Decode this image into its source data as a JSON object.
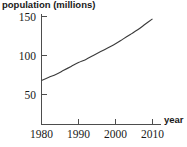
{
  "chart_data": {
    "type": "line",
    "title": "",
    "xlabel": "year",
    "ylabel": "population (millions)",
    "xlim": [
      1980,
      2012
    ],
    "ylim": [
      0,
      160
    ],
    "xticks": [
      1980,
      1990,
      2000,
      2010
    ],
    "yticks": [
      50,
      100,
      150
    ],
    "xtick_labels": [
      "1980",
      "1990",
      "2000",
      "2010"
    ],
    "ytick_labels": [
      "50",
      "100",
      "150"
    ],
    "grid": false,
    "legend": false,
    "series": [
      {
        "name": "population",
        "color": "#3b3b3b",
        "x": [
          1980,
          1982,
          1984,
          1986,
          1988,
          1990,
          1992,
          1994,
          1996,
          1998,
          2000,
          2002,
          2004,
          2006,
          2008,
          2010
        ],
        "y": [
          68,
          72,
          76,
          81,
          86,
          91,
          95,
          100,
          105,
          110,
          115,
          121,
          127,
          133,
          140,
          147
        ]
      }
    ],
    "axis_color": "#4d4d4d",
    "text_color": "#1a1a1a",
    "background": "#ffffff"
  },
  "labels": {
    "y_axis_title": "population (millions)",
    "x_axis_title": "year",
    "ytick_150": "150",
    "ytick_100": "100",
    "ytick_50": "50",
    "xtick_1980": "1980",
    "xtick_1990": "1990",
    "xtick_2000": "2000",
    "xtick_2010": "2010"
  }
}
